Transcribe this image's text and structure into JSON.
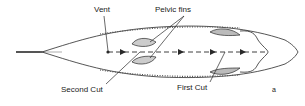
{
  "diagram": {
    "labels": {
      "vent": "Vent",
      "pelvic_fins": "Pelvic fins",
      "second_cut": "Second Cut",
      "first_cut": "First Cut",
      "panel": "a"
    },
    "colors": {
      "line": "#2a2a2a",
      "background": "#ffffff"
    }
  }
}
